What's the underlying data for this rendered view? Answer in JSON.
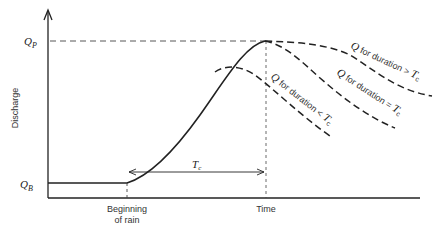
{
  "diagram": {
    "y_axis_label": "Discharge",
    "q_peak_label": "Q",
    "q_peak_sub": "P",
    "q_base_label": "Q",
    "q_base_sub": "B",
    "x_labels": {
      "rain_line1": "Beginning",
      "rain_line2": "of rain",
      "time": "Time"
    },
    "tc_label": "T",
    "tc_sub": "c",
    "curves": [
      {
        "label_q": "Q",
        "label_text": " for duration > ",
        "label_t": "T",
        "label_sub": "c"
      },
      {
        "label_q": "Q",
        "label_text": " for duration = ",
        "label_t": "T",
        "label_sub": "c"
      },
      {
        "label_q": "Q",
        "label_text": " for duration < ",
        "label_t": "T",
        "label_sub": "c"
      }
    ],
    "colors": {
      "line": "#222222",
      "text": "#333333",
      "background": "#ffffff"
    }
  }
}
